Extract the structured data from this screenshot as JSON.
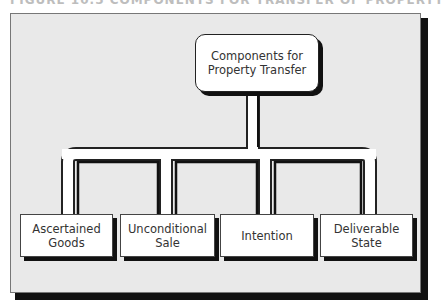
{
  "heading": {
    "text": "FIGURE 10.5   COMPONENTS FOR TRANSFER OF PROPERTY"
  },
  "diagram": {
    "root": {
      "line1": "Components for",
      "line2": "Property Transfer"
    },
    "children": [
      {
        "line1": "Ascertained",
        "line2": "Goods"
      },
      {
        "line1": "Unconditional",
        "line2": "Sale"
      },
      {
        "line1": "Intention",
        "line2": ""
      },
      {
        "line1": "Deliverable",
        "line2": "State"
      }
    ]
  },
  "colors": {
    "background": "#e9e9e9",
    "box": "#ffffff",
    "shadow": "#111111",
    "text": "#333333"
  }
}
